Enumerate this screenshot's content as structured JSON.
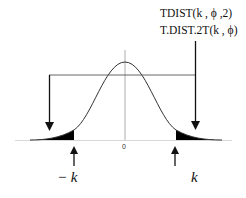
{
  "diagram": {
    "labels": {
      "function_1": "TDIST(k , ϕ ,2)",
      "function_2": "T.DIST.2T(k , ϕ)",
      "origin": "0",
      "negative_k": "− k",
      "positive_k": "k"
    },
    "colors": {
      "curve": "#333333",
      "shade": "#000000",
      "axis": "#cccccc",
      "arrow": "#111111"
    }
  }
}
